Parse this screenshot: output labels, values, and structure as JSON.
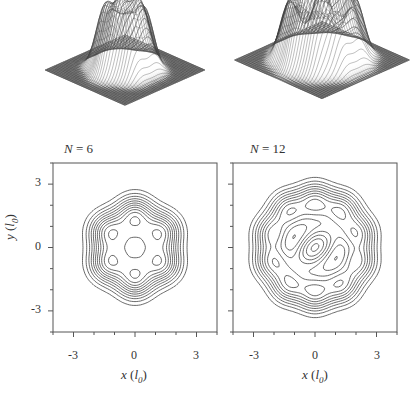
{
  "figure": {
    "panels": [
      {
        "id": "left",
        "label_var": "N",
        "label_eq": " = ",
        "label_val": "6",
        "n_peaks": 6
      },
      {
        "id": "right",
        "label_var": "N",
        "label_eq": " = ",
        "label_val": "12",
        "n_peaks": 12
      }
    ],
    "axes": {
      "xlabel_var": "x",
      "xlabel_unit": "l",
      "xlabel_sub": "0",
      "ylabel_var": "y",
      "ylabel_unit": "l",
      "ylabel_sub": "0",
      "xticks": [
        "-3",
        "0",
        "3"
      ],
      "yticks": [
        "3",
        "0",
        "-3"
      ]
    }
  },
  "chart_data": [
    {
      "type": "surface",
      "title": "N = 6",
      "description": "3D wireframe density surface with 6 peaks arranged in a ring"
    },
    {
      "type": "surface",
      "title": "N = 12",
      "description": "3D wireframe density surface with 12 peaks (outer ring plus inner structure)"
    },
    {
      "type": "contour",
      "title": "N = 6",
      "xlabel": "x (l0)",
      "ylabel": "y (l0)",
      "xlim": [
        -4,
        4
      ],
      "ylim": [
        -4,
        4
      ],
      "xticks": [
        -3,
        0,
        3
      ],
      "yticks": [
        -3,
        0,
        3
      ],
      "features": "hexagonal symmetry; 6 local maxima on ring radius ~1.5; central small peak at origin"
    },
    {
      "type": "contour",
      "title": "N = 12",
      "xlabel": "x (l0)",
      "ylabel": "",
      "xlim": [
        -4,
        4
      ],
      "ylim": [
        -4,
        4
      ],
      "xticks": [
        -3,
        0,
        3
      ],
      "yticks": [
        -3,
        0,
        3
      ],
      "features": "10 outer maxima on ring radius ~2.2; elongated central oval; two crescent-shaped intermediate features"
    }
  ]
}
